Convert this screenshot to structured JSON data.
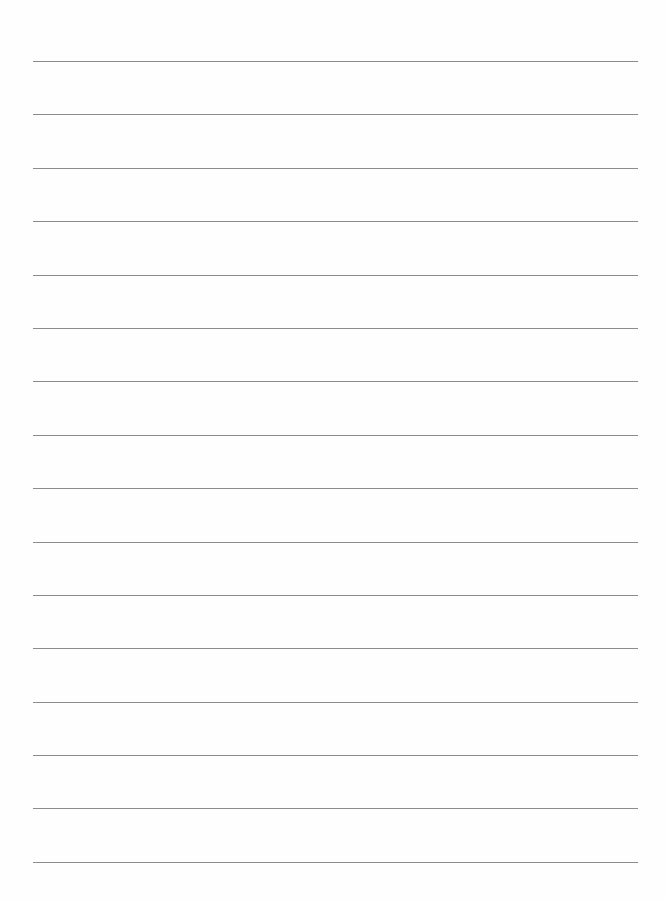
{
  "document": {
    "type": "lined-paper",
    "background_color": "#fefefe",
    "line_color": "#8c8c8c",
    "line_count": 16,
    "line_left": 33,
    "line_right": 638,
    "first_line_y": 61,
    "line_spacing": 53.4,
    "lines": [
      {
        "y": 61,
        "text": ""
      },
      {
        "y": 114,
        "text": ""
      },
      {
        "y": 168,
        "text": ""
      },
      {
        "y": 221,
        "text": ""
      },
      {
        "y": 275,
        "text": ""
      },
      {
        "y": 328,
        "text": ""
      },
      {
        "y": 381,
        "text": ""
      },
      {
        "y": 435,
        "text": ""
      },
      {
        "y": 488,
        "text": ""
      },
      {
        "y": 542,
        "text": ""
      },
      {
        "y": 595,
        "text": ""
      },
      {
        "y": 648,
        "text": ""
      },
      {
        "y": 702,
        "text": ""
      },
      {
        "y": 755,
        "text": ""
      },
      {
        "y": 808,
        "text": ""
      },
      {
        "y": 862,
        "text": ""
      }
    ]
  }
}
